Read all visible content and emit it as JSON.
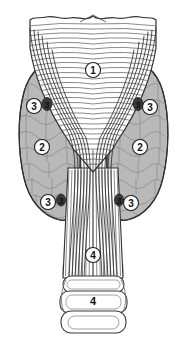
{
  "figure": {
    "background_color": "#ffffff",
    "width": 187,
    "height": 343,
    "line_color": "#2b2b2b",
    "lobe_fill_color": "#b9b9b9",
    "lobe_shade_color": "#a5a5a5",
    "cartilage_fill_color": "#ffffff",
    "marker_fill_color": "#ffffff",
    "marker_text_color": "#111111",
    "parathyroid_fill_color": "#3a3a3a"
  },
  "labels": [
    {
      "id": "callout-1",
      "text": "1",
      "style": "circled",
      "x": 93,
      "y": 70
    },
    {
      "id": "callout-2-left",
      "text": "2",
      "style": "circled",
      "x": 42,
      "y": 147
    },
    {
      "id": "callout-2-right",
      "text": "2",
      "style": "circled",
      "x": 140,
      "y": 147
    },
    {
      "id": "callout-3-upper-left",
      "text": "3",
      "style": "circled",
      "x": 34,
      "y": 106
    },
    {
      "id": "callout-3-upper-right",
      "text": "3",
      "style": "circled",
      "x": 150,
      "y": 107
    },
    {
      "id": "callout-3-lower-left",
      "text": "3",
      "style": "circled",
      "x": 48,
      "y": 202
    },
    {
      "id": "callout-3-lower-right",
      "text": "3",
      "style": "circled",
      "x": 131,
      "y": 203
    },
    {
      "id": "callout-4-trachea",
      "text": "4",
      "style": "circled",
      "x": 93,
      "y": 255
    },
    {
      "id": "callout-4-rings",
      "text": "4",
      "style": "plain",
      "x": 93,
      "y": 300
    }
  ],
  "parathyroid_marks": [
    {
      "id": "parathyroid-upper-left",
      "text": "3",
      "x": 47,
      "y": 104
    },
    {
      "id": "parathyroid-upper-right",
      "text": "3",
      "x": 138,
      "y": 104
    },
    {
      "id": "parathyroid-lower-left",
      "text": "3",
      "x": 61,
      "y": 200
    },
    {
      "id": "parathyroid-lower-right",
      "text": "3",
      "x": 119,
      "y": 200
    }
  ]
}
